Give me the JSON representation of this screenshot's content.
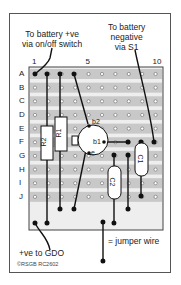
{
  "diagram": {
    "title_left": [
      "To battery +ve",
      "via on/off switch"
    ],
    "title_right": [
      "To battery",
      "negative",
      "via S1"
    ],
    "bottom_left": "+ve to GDO",
    "legend": "= jumper wire",
    "copyright": "©RSGB RC2602",
    "column_labels": [
      {
        "col": 1,
        "text": "1"
      },
      {
        "col": 5,
        "text": "5"
      },
      {
        "col": 10,
        "text": "10"
      }
    ],
    "row_labels": [
      "A",
      "B",
      "C",
      "D",
      "E",
      "F",
      "G",
      "H",
      "I",
      "J"
    ],
    "components": [
      {
        "id": "R2",
        "label": "R2",
        "type": "resistor"
      },
      {
        "id": "R1",
        "label": "R1",
        "type": "resistor"
      },
      {
        "id": "C2",
        "label": "C2",
        "type": "capacitor"
      },
      {
        "id": "C1",
        "label": "C1",
        "type": "capacitor"
      },
      {
        "id": "TR1",
        "type": "unijunction-transistor",
        "pins": [
          "b2",
          "b1",
          "e"
        ]
      }
    ],
    "colors": {
      "strip": "#c8c8c8",
      "board_border": "#444",
      "wire": "#111",
      "hole": "#fff"
    }
  }
}
